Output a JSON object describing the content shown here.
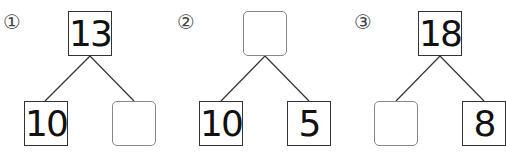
{
  "problems": [
    {
      "label": "①",
      "top": "13",
      "bottom_left": "10",
      "bottom_right": ""
    },
    {
      "label": "②",
      "top": "",
      "bottom_left": "10",
      "bottom_right": "5"
    },
    {
      "label": "③",
      "top": "18",
      "bottom_left": "",
      "bottom_right": "8"
    }
  ]
}
